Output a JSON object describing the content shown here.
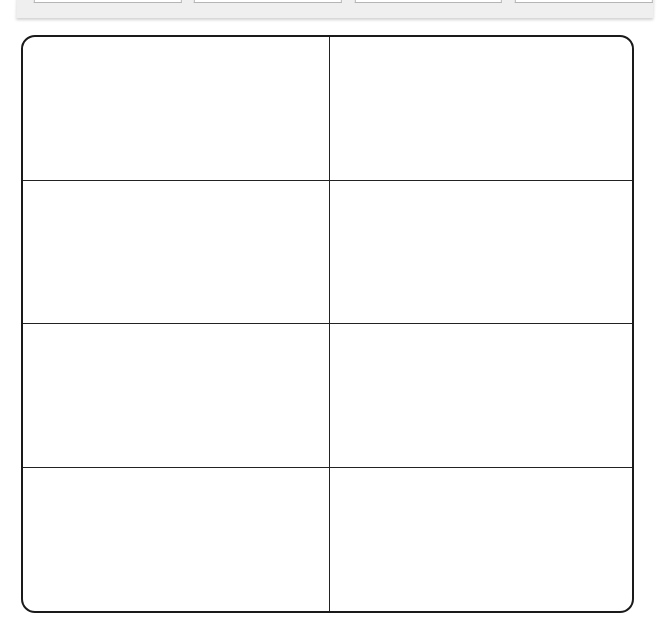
{
  "top_strip": {
    "boxes": [
      {
        "label": "",
        "left": 17,
        "width": 146
      },
      {
        "label": "",
        "left": 177,
        "width": 146
      },
      {
        "label": "",
        "left": 338,
        "width": 145
      },
      {
        "label": "",
        "left": 498,
        "width": 136
      }
    ],
    "background": "#efefef"
  },
  "table": {
    "rows": 4,
    "columns": 2,
    "cells": [
      [
        "",
        ""
      ],
      [
        "",
        ""
      ],
      [
        "",
        ""
      ],
      [
        "",
        ""
      ]
    ],
    "border_color": "#1a1a1a"
  }
}
